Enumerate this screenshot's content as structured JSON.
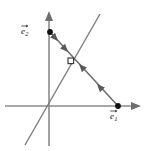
{
  "figure": {
    "kind": "vector-diagram",
    "background_color": "#ffffff",
    "width": 147,
    "height": 151
  },
  "axes": {
    "x_axis": {
      "name": "horizontal-axis",
      "color": "#8a8a8a",
      "y": 106,
      "x_start": 5,
      "x_end": 137,
      "arrow": "right"
    },
    "y_axis": {
      "name": "vertical-axis",
      "color": "#8a8a8a",
      "x": 49,
      "y_start": 145,
      "y_end": 14,
      "arrow": "up"
    },
    "origin": {
      "x": 49,
      "y": 106
    }
  },
  "span_line": {
    "name": "diagonal-span-line",
    "color": "#7c7c7c",
    "x1": 25,
    "y1": 145,
    "x2": 100,
    "y2": 14
  },
  "basis_vectors": [
    {
      "id": "e2",
      "label_base": "e",
      "label_subscript": "2",
      "dot_color": "#111111",
      "x": 50,
      "y": 32
    },
    {
      "id": "e1",
      "label_base": "e",
      "label_subscript": "1",
      "dot_color": "#111111",
      "x": 118,
      "y": 106
    }
  ],
  "connecting_segment": {
    "name": "e2-to-e1-segment",
    "color": "#6b6b6b",
    "from": {
      "x": 50,
      "y": 32
    },
    "to": {
      "x": 118,
      "y": 106
    },
    "arrow_count": 4,
    "arrow_directions": [
      "down-right",
      "down-right",
      "up-left",
      "up-left"
    ]
  },
  "intersection_marker": {
    "name": "open-point-marker",
    "shape": "open-square",
    "fill": "#ffffff",
    "stroke": "#3b3b3b",
    "x": 71,
    "y": 61
  },
  "colors": {
    "axis": "#8a8a8a",
    "line": "#7c7c7c",
    "arrow": "#5a5a5a",
    "point": "#111111",
    "background": "#ffffff"
  }
}
